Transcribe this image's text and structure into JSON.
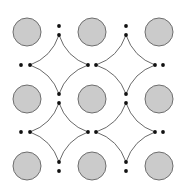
{
  "diagram": {
    "width": 181,
    "height": 189,
    "colors": {
      "background": "#ffffff",
      "circle_fill": "#cbcbcb",
      "circle_stroke": "#6e6e6e",
      "curve_stroke": "#6a6a6a",
      "dot_fill": "#111111"
    },
    "circle_radius": 14,
    "circles": [
      {
        "x": 27,
        "y": 32
      },
      {
        "x": 92,
        "y": 32
      },
      {
        "x": 159,
        "y": 32
      },
      {
        "x": 27,
        "y": 99
      },
      {
        "x": 92,
        "y": 99
      },
      {
        "x": 159,
        "y": 99
      },
      {
        "x": 27,
        "y": 166
      },
      {
        "x": 92,
        "y": 166
      },
      {
        "x": 159,
        "y": 166
      }
    ],
    "stars": [
      {
        "cx": 59,
        "cy": 65,
        "top": 35,
        "bottom": 94,
        "left": 30,
        "right": 88
      },
      {
        "cx": 126,
        "cy": 65,
        "top": 35,
        "bottom": 94,
        "left": 96,
        "right": 155
      },
      {
        "cx": 59,
        "cy": 132,
        "top": 103,
        "bottom": 162,
        "left": 30,
        "right": 88
      },
      {
        "cx": 126,
        "cy": 132,
        "top": 103,
        "bottom": 162,
        "left": 96,
        "right": 155
      }
    ],
    "dot_radius": 1.9,
    "dots": [
      {
        "x": 59,
        "y": 26
      },
      {
        "x": 59,
        "y": 35
      },
      {
        "x": 126,
        "y": 26
      },
      {
        "x": 126,
        "y": 35
      },
      {
        "x": 21,
        "y": 65
      },
      {
        "x": 30,
        "y": 65
      },
      {
        "x": 88,
        "y": 65
      },
      {
        "x": 96,
        "y": 65
      },
      {
        "x": 155,
        "y": 65
      },
      {
        "x": 163,
        "y": 65
      },
      {
        "x": 59,
        "y": 94
      },
      {
        "x": 59,
        "y": 103
      },
      {
        "x": 126,
        "y": 94
      },
      {
        "x": 126,
        "y": 103
      },
      {
        "x": 21,
        "y": 132
      },
      {
        "x": 30,
        "y": 132
      },
      {
        "x": 88,
        "y": 132
      },
      {
        "x": 96,
        "y": 132
      },
      {
        "x": 155,
        "y": 132
      },
      {
        "x": 163,
        "y": 132
      },
      {
        "x": 59,
        "y": 162
      },
      {
        "x": 59,
        "y": 171
      },
      {
        "x": 126,
        "y": 162
      },
      {
        "x": 126,
        "y": 171
      }
    ]
  }
}
